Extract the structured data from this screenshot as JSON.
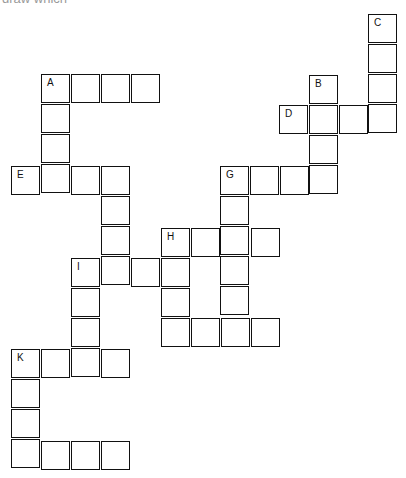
{
  "header": {
    "cut_off_text": "draw which"
  },
  "puzzle": {
    "type": "crossword",
    "cell_size": 30,
    "clues": [
      {
        "label": "A",
        "direction": "across",
        "x": 41,
        "y": 74,
        "length": 4
      },
      {
        "label": "A",
        "direction": "down",
        "x": 41,
        "y": 74,
        "length": 4
      },
      {
        "label": "B",
        "direction": "down",
        "x": 309,
        "y": 75,
        "length": 4
      },
      {
        "label": "C",
        "direction": "down",
        "x": 368,
        "y": 14,
        "length": 4
      },
      {
        "label": "D",
        "direction": "across",
        "x": 279,
        "y": 105,
        "length": 4
      },
      {
        "label": "E",
        "direction": "across",
        "x": 11,
        "y": 166,
        "length": 4
      },
      {
        "label": "F",
        "direction": "down",
        "x": 101,
        "y": 166,
        "length": 4
      },
      {
        "label": "G",
        "direction": "across",
        "x": 220,
        "y": 166,
        "length": 4
      },
      {
        "label": "G",
        "direction": "down",
        "x": 220,
        "y": 166,
        "length": 5
      },
      {
        "label": "H",
        "direction": "across",
        "x": 161,
        "y": 228,
        "length": 4
      },
      {
        "label": "H",
        "direction": "down",
        "x": 161,
        "y": 228,
        "length": 4
      },
      {
        "label": "I",
        "direction": "across",
        "x": 71,
        "y": 258,
        "length": 4
      },
      {
        "label": "I",
        "direction": "down",
        "x": 71,
        "y": 258,
        "length": 4
      },
      {
        "label": "J",
        "direction": "across",
        "x": 161,
        "y": 318,
        "length": 4
      },
      {
        "label": "K",
        "direction": "across",
        "x": 11,
        "y": 349,
        "length": 4
      },
      {
        "label": "K",
        "direction": "down",
        "x": 11,
        "y": 349,
        "length": 4
      },
      {
        "label": "L",
        "direction": "across",
        "x": 11,
        "y": 441,
        "length": 4
      }
    ],
    "labels": [
      "A",
      "B",
      "C",
      "D",
      "E",
      "F",
      "G",
      "H",
      "I",
      "J",
      "K",
      "L"
    ]
  }
}
